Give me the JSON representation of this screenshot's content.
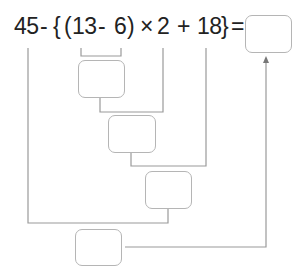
{
  "expression": {
    "t45": "45",
    "minus1": "-",
    "brace_open": "{",
    "paren_open": "(",
    "t13": "13",
    "minus2": "-",
    "t6": "6",
    "paren_close": ")",
    "times": "×",
    "t2": "2",
    "plus": "+",
    "t18": "18",
    "brace_close": "}",
    "equals": "="
  },
  "answer_boxes": [
    {
      "id": "step1",
      "value": ""
    },
    {
      "id": "step2",
      "value": ""
    },
    {
      "id": "step3",
      "value": ""
    },
    {
      "id": "step4",
      "value": ""
    },
    {
      "id": "final",
      "value": ""
    }
  ],
  "colors": {
    "line": "#9a9a9a",
    "box_border": "#b5b5b5",
    "text": "#222222"
  }
}
